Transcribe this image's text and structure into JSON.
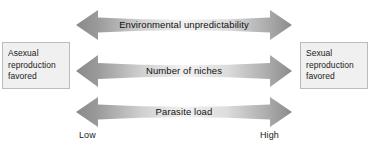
{
  "figure": {
    "left_box": {
      "name": "asexual-outcome-box",
      "lines": [
        "Asexual",
        "reproduction",
        "favored"
      ]
    },
    "right_box": {
      "name": "sexual-outcome-box",
      "lines": [
        "Sexual",
        "reproduction",
        "favored"
      ]
    },
    "arrows": [
      {
        "label": "Environmental unpredictability"
      },
      {
        "label": "Number of niches"
      },
      {
        "label": "Parasite load"
      }
    ],
    "axis": {
      "low_label": "Low",
      "high_label": "High"
    },
    "colors": {
      "arrow_end": "#8d8d8d",
      "arrow_mid": "#f4f4f4",
      "box_fill": "#f0f0f0",
      "box_border": "#bcbcbc",
      "text": "#111111",
      "background": "#ffffff"
    }
  }
}
